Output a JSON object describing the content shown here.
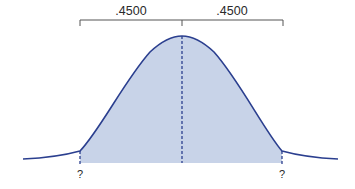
{
  "diagram": {
    "type": "normal-distribution",
    "brackets": [
      {
        "label": ".4500"
      },
      {
        "label": ".4500"
      }
    ],
    "markers": [
      {
        "label": "?"
      },
      {
        "label": "?"
      }
    ],
    "colors": {
      "curve": "#2b3f8f",
      "fill": "#c8d3e8",
      "bracket": "#555555"
    }
  }
}
